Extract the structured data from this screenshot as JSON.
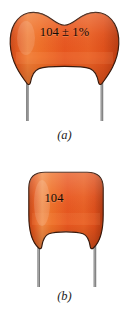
{
  "figure": {
    "background_color": "#ffffff",
    "body_color": "#e8561f",
    "body_highlight_color": "#f4833f",
    "body_shadow_color": "#b83c12",
    "outline_color": "#3a1a0c",
    "lead_color": "#8a8a8a",
    "text_color": "#120a06"
  },
  "panels": [
    {
      "id": "a",
      "caption": "(a)",
      "marking": "104 ± 1%",
      "shape": "dog-bone ceramic capacitor with concave top and two radial leads",
      "lead_count": 2
    },
    {
      "id": "b",
      "caption": "(b)",
      "marking": "104",
      "shape": "rounded rectangular ceramic capacitor with two radial leads",
      "lead_count": 2
    }
  ]
}
